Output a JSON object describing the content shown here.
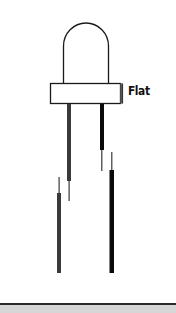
{
  "diagram": {
    "labels": {
      "flat": "Flat"
    },
    "parts": {
      "dome": "led-dome",
      "flange": "led-flange",
      "flat_side": "flat-side-marker",
      "lead_left": "anode-lead",
      "lead_right": "cathode-lead"
    },
    "colors": {
      "outline": "#1a1a1a",
      "lead_left": "#3a3a3a",
      "lead_right": "#0a0a0a",
      "flat_marker": "#555555",
      "bottom_rule": "#2a2a2a",
      "bottom_band": "#d6d6d6",
      "background": "#ffffff"
    }
  }
}
